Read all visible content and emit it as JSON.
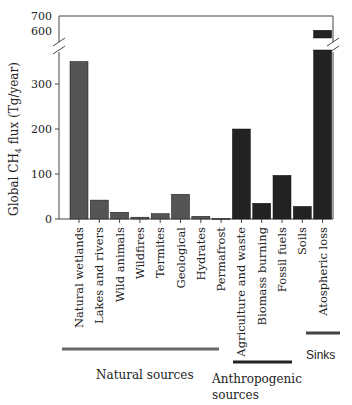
{
  "chart_data": {
    "type": "bar",
    "title": "",
    "xlabel": "",
    "ylabel": "Global CH4 flux (Tg/year)",
    "ylabel_main": "Global CH",
    "ylabel_sub": "4",
    "ylabel_tail": " flux (Tg/year)",
    "axis_break": {
      "lower_range": [
        0,
        370
      ],
      "upper_range": [
        580,
        700
      ]
    },
    "yticks_lower": [
      0,
      100,
      200,
      300
    ],
    "yticks_upper": [
      600,
      700
    ],
    "grid": false,
    "categories": [
      "Natural wetlands",
      "Lakes and rivers",
      "Wild animals",
      "Wildfires",
      "Termites",
      "Geological",
      "Hydrates",
      "Permafrost",
      "Agriculture and waste",
      "Biomass burning",
      "Fossil fuels",
      "Soils",
      "Atospheric loss"
    ],
    "values": [
      350,
      42,
      15,
      4,
      12,
      55,
      6,
      1,
      200,
      35,
      97,
      28,
      605
    ],
    "groups": [
      {
        "name": "Natural sources",
        "categories": [
          "Natural wetlands",
          "Lakes and rivers",
          "Wild animals",
          "Wildfires",
          "Termites",
          "Geological",
          "Hydrates",
          "Permafrost"
        ],
        "color": "#555555"
      },
      {
        "name": "Anthropogenic sources",
        "categories": [
          "Agriculture and waste",
          "Biomass burning",
          "Fossil fuels"
        ],
        "color": "#222222"
      },
      {
        "name": "Sinks",
        "categories": [
          "Soils",
          "Atospheric loss"
        ],
        "color": "#222222"
      }
    ]
  },
  "group_labels": {
    "natural": "Natural sources",
    "anthropogenic_line1": "Anthropogenic",
    "anthropogenic_line2": "sources",
    "sinks": "Sinks"
  }
}
